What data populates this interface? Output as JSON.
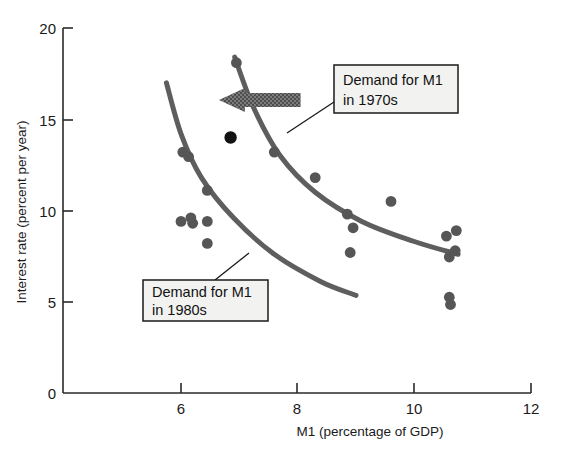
{
  "chart_data": {
    "type": "scatter",
    "title": "",
    "xlabel": "M1 (percentage of GDP)",
    "ylabel": "Interest rate (percent per year)",
    "xlim": [
      4.6,
      12
    ],
    "ylim": [
      0,
      20
    ],
    "xticks": [
      6,
      8,
      10,
      12
    ],
    "xtick_labels": [
      "6",
      "8",
      "10",
      "12"
    ],
    "yticks": [
      0,
      5,
      10,
      15,
      20
    ],
    "ytick_labels": [
      "0",
      "5",
      "10",
      "15",
      "20"
    ],
    "grid": false,
    "legend": "none",
    "marker_color": "#565656",
    "highlight_marker_color": "#121212",
    "curve_color": "#5e5e5e",
    "arrow_color": "#6d6d6d",
    "points": [
      {
        "x": 6.85,
        "y": 14.0,
        "highlight": true
      },
      {
        "x": 6.03,
        "y": 13.2,
        "highlight": false
      },
      {
        "x": 6.13,
        "y": 12.95,
        "highlight": false
      },
      {
        "x": 6.45,
        "y": 11.1,
        "highlight": false
      },
      {
        "x": 6.0,
        "y": 9.4,
        "highlight": false
      },
      {
        "x": 6.17,
        "y": 9.6,
        "highlight": false
      },
      {
        "x": 6.2,
        "y": 9.3,
        "highlight": false
      },
      {
        "x": 6.45,
        "y": 9.4,
        "highlight": false
      },
      {
        "x": 6.45,
        "y": 8.2,
        "highlight": false
      },
      {
        "x": 6.95,
        "y": 18.1,
        "highlight": false
      },
      {
        "x": 7.6,
        "y": 13.2,
        "highlight": false
      },
      {
        "x": 8.3,
        "y": 11.8,
        "highlight": false
      },
      {
        "x": 8.85,
        "y": 9.8,
        "highlight": false
      },
      {
        "x": 8.95,
        "y": 9.05,
        "highlight": false
      },
      {
        "x": 8.9,
        "y": 7.7,
        "highlight": false
      },
      {
        "x": 9.6,
        "y": 10.5,
        "highlight": false
      },
      {
        "x": 10.55,
        "y": 8.6,
        "highlight": false
      },
      {
        "x": 10.72,
        "y": 8.9,
        "highlight": false
      },
      {
        "x": 10.7,
        "y": 7.8,
        "highlight": false
      },
      {
        "x": 10.6,
        "y": 7.45,
        "highlight": false
      },
      {
        "x": 10.6,
        "y": 5.25,
        "highlight": false
      },
      {
        "x": 10.62,
        "y": 4.85,
        "highlight": false
      }
    ],
    "curves": [
      {
        "name": "Demand for M1 in 1970s",
        "path": [
          [
            6.92,
            18.4
          ],
          [
            7.25,
            15.6
          ],
          [
            7.7,
            13.0
          ],
          [
            8.3,
            11.0
          ],
          [
            9.1,
            9.4
          ],
          [
            10.0,
            8.3
          ],
          [
            10.75,
            7.6
          ]
        ]
      },
      {
        "name": "Demand for M1 in 1980s",
        "path": [
          [
            5.75,
            17.0
          ],
          [
            6.0,
            14.2
          ],
          [
            6.35,
            11.8
          ],
          [
            6.9,
            9.6
          ],
          [
            7.6,
            7.6
          ],
          [
            8.4,
            6.1
          ],
          [
            9.0,
            5.35
          ]
        ]
      }
    ],
    "annotations": [
      {
        "id": "label-1970s",
        "line1": "Demand for M1",
        "line2": "in 1970s"
      },
      {
        "id": "label-1980s",
        "line1": "Demand for M1",
        "line2": "in 1980s"
      }
    ],
    "arrow": {
      "direction": "left",
      "from_x": 8.05,
      "to_x": 6.65,
      "y": 16.05
    }
  }
}
